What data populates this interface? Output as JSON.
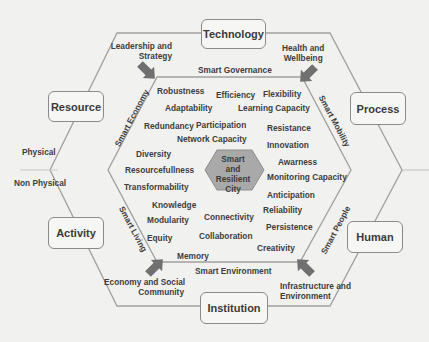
{
  "diagram": {
    "center": {
      "lines": [
        "Smart",
        "and",
        "Resilient",
        "City"
      ]
    },
    "outer_boxes": {
      "top": "Technology",
      "upper_left": "Resource",
      "upper_right": "Process",
      "lower_left": "Activity",
      "lower_right": "Human",
      "bottom": "Institution"
    },
    "left_labels": {
      "physical": "Physical",
      "non_physical": "Non Physical"
    },
    "corner_labels": {
      "top_left": [
        "Leadership and",
        "Strategy"
      ],
      "top_right": [
        "Health and",
        "Wellbeing"
      ],
      "bottom_left": [
        "Economy and Social",
        "Community"
      ],
      "bottom_right": [
        "Infrastructure and",
        "Environment"
      ]
    },
    "side_labels": {
      "top": "Smart Governance",
      "left_upper": "Smart Economy",
      "right_upper": "Smart Mobility",
      "left_lower": "Smart Living",
      "right_lower": "Smart People",
      "bottom": "Smart Environment"
    },
    "attributes": [
      "Robustness",
      "Efficiency",
      "Flexibility",
      "Adaptability",
      "Learning Capacity",
      "Redundancy",
      "Participation",
      "Resistance",
      "Network Capacity",
      "Innovation",
      "Diversity",
      "Awarness",
      "Resourcefullness",
      "Monitoring Capacity",
      "Transformability",
      "Anticipation",
      "Knowledge",
      "Reliability",
      "Modularity",
      "Connectivity",
      "Persistence",
      "Equity",
      "Collaboration",
      "Creativity",
      "Memory"
    ],
    "colors": {
      "background": "#f1f1ef",
      "lines": "#9a9a9a",
      "arrow": "#6e6e6e",
      "center_hexagon": "#a9a9a9",
      "text": "#3d3d3d"
    }
  }
}
